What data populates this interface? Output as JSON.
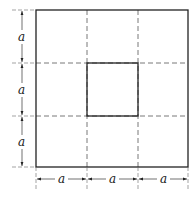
{
  "diagram": {
    "dimension_label": "a",
    "left_labels": [
      "a",
      "a",
      "a"
    ],
    "bottom_labels": [
      "a",
      "a",
      "a"
    ],
    "grid": {
      "rows": 3,
      "cols": 3
    },
    "colors": {
      "line": "#222222",
      "dash": "#555555",
      "background": "#ffffff"
    }
  }
}
